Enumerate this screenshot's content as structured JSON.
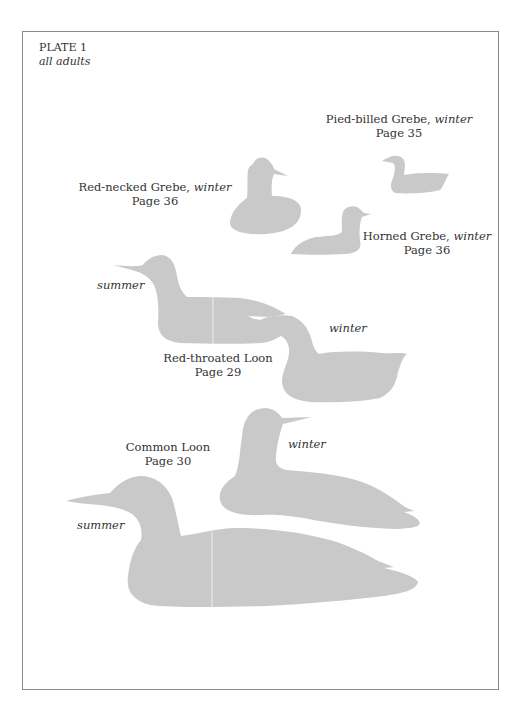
{
  "plate": {
    "title": "PLATE 1",
    "subtitle": "all adults"
  },
  "colors": {
    "silhouette": "#c9c9c9",
    "text": "#333333",
    "frame": "#8a8a8a",
    "background": "#ffffff"
  },
  "species": [
    {
      "name": "Pied-billed Grebe",
      "separator": ", ",
      "plumage": "winter",
      "page": "Page 35"
    },
    {
      "name": "Red-necked Grebe",
      "separator": ", ",
      "plumage": "winter",
      "page": "Page 36"
    },
    {
      "name": "Horned Grebe",
      "separator": ", ",
      "plumage": "winter",
      "page": "Page 36"
    },
    {
      "name": "Red-throated Loon",
      "page": "Page 29",
      "labels": {
        "summer": "summer",
        "winter": "winter"
      }
    },
    {
      "name": "Common Loon",
      "page": "Page 30",
      "labels": {
        "summer": "summer",
        "winter": "winter"
      }
    }
  ]
}
